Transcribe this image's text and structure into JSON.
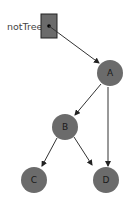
{
  "diagram": {
    "variable": {
      "name": "notTree",
      "points_to": "A"
    },
    "nodes": [
      {
        "id": "A",
        "label": "A"
      },
      {
        "id": "B",
        "label": "B"
      },
      {
        "id": "C",
        "label": "C"
      },
      {
        "id": "D",
        "label": "D"
      }
    ],
    "edges": [
      {
        "from": "notTree",
        "to": "A"
      },
      {
        "from": "A",
        "to": "B"
      },
      {
        "from": "A",
        "to": "D"
      },
      {
        "from": "B",
        "to": "C"
      },
      {
        "from": "B",
        "to": "D"
      }
    ],
    "colors": {
      "node_fill": "#6b6b6b",
      "edge": "#333333",
      "label": "#1a1a1a"
    }
  }
}
